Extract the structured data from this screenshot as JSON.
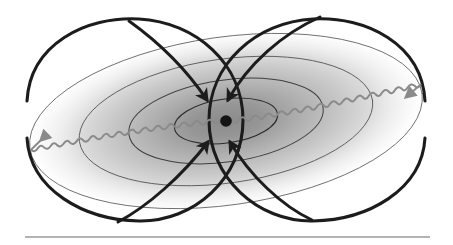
{
  "figure": {
    "description": "A central point mass surrounded by concentric tilted elliptical field contours shaded with a radial gradient, four black curved arrows converging inward on the centre, a grey sinusoidal wave passing horizontally through the centre with arrowheads at both ends, and two large black loop curves crossing near the centre.",
    "background_color": "#ffffff"
  },
  "canvas": {
    "width": 453,
    "height": 245
  },
  "center_point": {
    "label": "central-mass",
    "x": 226,
    "y": 121,
    "radius": 5.8,
    "color": "#141414"
  },
  "gradient_field": {
    "label": "radial-gradient-field",
    "center_color": "#8e8e8e",
    "mid_color": "#c9c9c9",
    "edge_color": "#ffffff",
    "tilt_degrees": -8
  },
  "ellipses": {
    "label": "concentric-field-contours",
    "count": 4,
    "stroke_color": "#4a4a4a",
    "stroke_widths": [
      0.9,
      0.9,
      1.0,
      1.1
    ],
    "rx": [
      198,
      148,
      98,
      52
    ],
    "ry": [
      84,
      62,
      41,
      22
    ],
    "tilt_degrees": -8
  },
  "loops": {
    "label": "field-loop-curves",
    "stroke_color": "#1c1c1c",
    "stroke_width": 3.1,
    "left": {
      "cx": 131,
      "cy": 120,
      "rx": 112,
      "ry": 104
    },
    "right": {
      "cx": 321,
      "cy": 120,
      "rx": 112,
      "ry": 104
    }
  },
  "arrows_inward": {
    "label": "converging-arrows",
    "count": 4,
    "color": "#1c1c1c",
    "stroke_width": 3.0,
    "directions": [
      "top-left-inward",
      "top-right-inward",
      "bottom-left-inward",
      "bottom-right-inward"
    ]
  },
  "wave": {
    "label": "sinusoidal-wave",
    "color": "#8a8a8a",
    "stroke_width": 2.0,
    "wavelength": 13,
    "amplitude": 4.5,
    "left_end": {
      "x": 22,
      "y": 141
    },
    "right_end": {
      "x": 430,
      "y": 92
    },
    "arrowheads": [
      "left",
      "right"
    ],
    "arrowhead_color": "#8a8a8a"
  },
  "rule": {
    "label": "bottom-separator-rule",
    "x1": 25,
    "x2": 430,
    "y": 237,
    "color": "#9a9a9a",
    "thickness": 1.4
  }
}
